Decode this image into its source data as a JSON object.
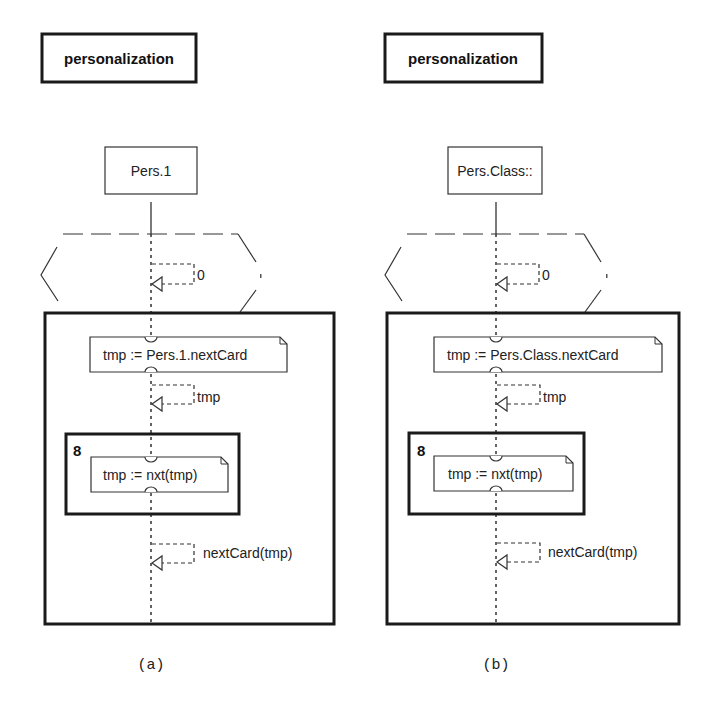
{
  "figure": {
    "panels": [
      {
        "caption": "(a)",
        "diagram_name": "personalization",
        "object_label": "Pers.1",
        "guard_return": "0",
        "note_first": "tmp := Pers.1.nextCard",
        "return_first": "tmp",
        "loop_count": "8",
        "note_loop": "tmp := nxt(tmp)",
        "return_last": "nextCard(tmp)"
      },
      {
        "caption": "(b)",
        "diagram_name": "personalization",
        "object_label": "Pers.Class::",
        "guard_return": "0",
        "note_first": "tmp := Pers.Class.nextCard",
        "return_first": "tmp",
        "loop_count": "8",
        "note_loop": "tmp := nxt(tmp)",
        "return_last": "nextCard(tmp)"
      }
    ],
    "colors": {
      "stroke": "#1a1a1a",
      "background": "#ffffff"
    }
  }
}
